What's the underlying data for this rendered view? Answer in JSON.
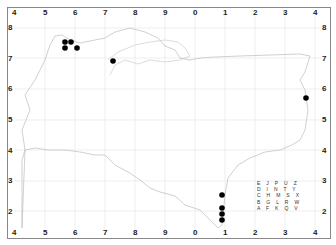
{
  "map": {
    "title": "",
    "x_ticks_top": [
      "4",
      "5",
      "6",
      "7",
      "8",
      "9",
      "0",
      "1",
      "2",
      "3",
      "4"
    ],
    "x_ticks_bottom": [
      "4",
      "5",
      "6",
      "7",
      "8",
      "9",
      "0",
      "1",
      "2",
      "3",
      "4"
    ],
    "y_ticks_left": [
      "8",
      "7",
      "6",
      "5",
      "4",
      "3",
      "2"
    ],
    "y_ticks_right": [
      "8",
      "7",
      "6",
      "5",
      "4",
      "3",
      "2"
    ],
    "letter_grid": [
      "E J P U Z",
      "D I N T Y",
      "C H M S X",
      "B G L R W",
      "A F K Q V"
    ],
    "colors": {
      "dot": "#000000",
      "grid": "#dddddd",
      "coast": "#bbbbbb",
      "border": "#888888"
    },
    "points": [
      {
        "x": 65,
        "y": 42
      },
      {
        "x": 71,
        "y": 42
      },
      {
        "x": 65,
        "y": 48
      },
      {
        "x": 77,
        "y": 48
      },
      {
        "x": 113,
        "y": 61
      },
      {
        "x": 306,
        "y": 98
      },
      {
        "x": 222,
        "y": 195
      },
      {
        "x": 222,
        "y": 208
      },
      {
        "x": 222,
        "y": 214
      },
      {
        "x": 222,
        "y": 220
      }
    ]
  }
}
